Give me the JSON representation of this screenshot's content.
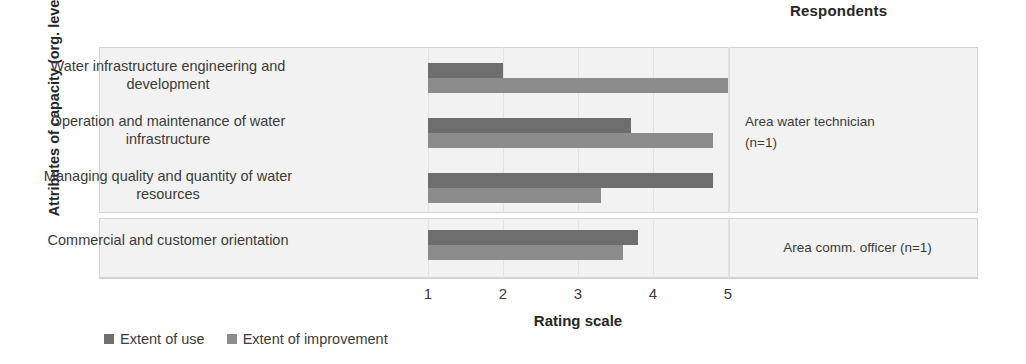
{
  "header": {
    "respondents_title": "Respondents"
  },
  "axes": {
    "y_title": "Attributes of capacity (org. level)",
    "x_title": "Rating scale",
    "x_ticks": [
      "1",
      "2",
      "3",
      "4",
      "5"
    ]
  },
  "legend": {
    "items": [
      {
        "label": "Extent of use",
        "color": "#6e6e6e",
        "key": "use"
      },
      {
        "label": "Extent of improvement",
        "color": "#8c8c8c",
        "key": "improvement"
      }
    ]
  },
  "groups": [
    {
      "label_line1": "Area water technician",
      "label_line2": "(n=1)"
    },
    {
      "label_line1": "Area comm. officer (n=1)",
      "label_line2": ""
    }
  ],
  "chart_data": {
    "type": "bar",
    "orientation": "horizontal",
    "title": "",
    "xlabel": "Rating scale",
    "ylabel": "Attributes of capacity (org. level)",
    "xlim": [
      1,
      5
    ],
    "xticks": [
      1,
      2,
      3,
      4,
      5
    ],
    "grid": true,
    "legend_position": "bottom-left",
    "categories": [
      "Water infrastructure engineering and development",
      "Operation and maintenance of  water infrastructure",
      "Managing quality and quantity of water resources",
      "Commercial and customer orientation"
    ],
    "series": [
      {
        "name": "Extent of use",
        "color": "#6e6e6e",
        "values": [
          2.0,
          3.7,
          4.8,
          3.8
        ]
      },
      {
        "name": "Extent of improvement",
        "color": "#8c8c8c",
        "values": [
          5.0,
          4.8,
          3.3,
          3.6
        ]
      }
    ],
    "groups": [
      {
        "name": "Area water technician (n=1)",
        "categories": [
          0,
          1,
          2
        ]
      },
      {
        "name": "Area comm. officer (n=1)",
        "categories": [
          3
        ]
      }
    ]
  }
}
